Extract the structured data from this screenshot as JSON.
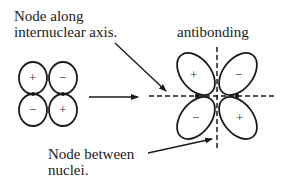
{
  "labels": {
    "node_axis_line1": "Node along",
    "node_axis_line2": "internuclear axis.",
    "antibonding": "antibonding",
    "node_between_line1": "Node between",
    "node_between_line2": "nuclei."
  },
  "left_orbitals": {
    "top_left_sign": "+",
    "top_right_sign": "−",
    "bottom_left_sign": "−",
    "bottom_right_sign": "+"
  },
  "antibonding_orbital": {
    "upper_left_sign": "+",
    "upper_right_sign": "−",
    "lower_left_sign": "−",
    "lower_right_sign": "+"
  },
  "colors": {
    "stroke": "#1a1a1a",
    "background": "#ffffff"
  }
}
